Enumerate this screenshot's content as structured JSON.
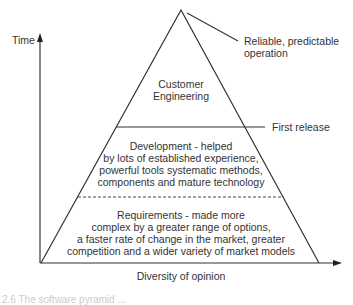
{
  "diagram": {
    "axes": {
      "y_label": "Time",
      "x_label": "Diversity of opinion"
    },
    "annotations": {
      "apex": "Reliable, predictable operation",
      "apex_lines": [
        "Reliable, predictable",
        "operation"
      ],
      "first_release": "First release"
    },
    "layers": [
      {
        "name": "Customer Engineering",
        "lines": [
          "Customer",
          "Engineering"
        ]
      },
      {
        "name": "Development",
        "lines": [
          "Development - helped",
          "by lots of established experience,",
          "powerful tools systematic methods,",
          "components and mature technology"
        ]
      },
      {
        "name": "Requirements",
        "lines": [
          "Requirements - made more",
          "complex by a greater range of options,",
          "a faster rate of change in the market, greater",
          "competition and a wider variety of market models"
        ]
      }
    ],
    "caption": "2.6 The software pyramid ..."
  }
}
